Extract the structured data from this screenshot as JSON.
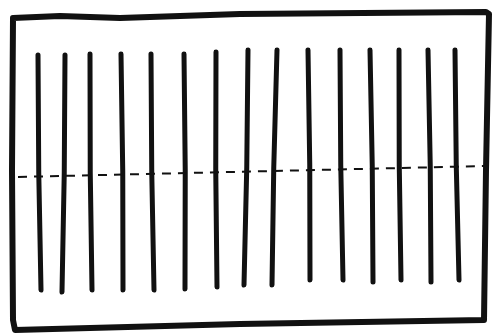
{
  "diagram": {
    "stroke_color": "#111111",
    "background": "#ffffff",
    "frame": {
      "points": [
        [
          13,
          18
        ],
        [
          60,
          16
        ],
        [
          120,
          18
        ],
        [
          240,
          14
        ],
        [
          486,
          12
        ],
        [
          489,
          14
        ],
        [
          486,
          170
        ],
        [
          484,
          320
        ],
        [
          240,
          324
        ],
        [
          15,
          330
        ],
        [
          13,
          320
        ],
        [
          12,
          170
        ],
        [
          13,
          18
        ]
      ],
      "stroke_width": 6
    },
    "vertical_lines": [
      {
        "x_top": 38,
        "y_top": 55,
        "x_bottom": 41,
        "y_bottom": 290
      },
      {
        "x_top": 65,
        "y_top": 55,
        "x_bottom": 62,
        "y_bottom": 292
      },
      {
        "x_top": 90,
        "y_top": 54,
        "x_bottom": 92,
        "y_bottom": 290
      },
      {
        "x_top": 121,
        "y_top": 54,
        "x_bottom": 123,
        "y_bottom": 290
      },
      {
        "x_top": 151,
        "y_top": 54,
        "x_bottom": 154,
        "y_bottom": 290
      },
      {
        "x_top": 184,
        "y_top": 54,
        "x_bottom": 185,
        "y_bottom": 289
      },
      {
        "x_top": 216,
        "y_top": 52,
        "x_bottom": 217,
        "y_bottom": 287
      },
      {
        "x_top": 248,
        "y_top": 50,
        "x_bottom": 244,
        "y_bottom": 285
      },
      {
        "x_top": 277,
        "y_top": 50,
        "x_bottom": 272,
        "y_bottom": 285
      },
      {
        "x_top": 308,
        "y_top": 50,
        "x_bottom": 310,
        "y_bottom": 280
      },
      {
        "x_top": 340,
        "y_top": 50,
        "x_bottom": 343,
        "y_bottom": 280
      },
      {
        "x_top": 370,
        "y_top": 50,
        "x_bottom": 373,
        "y_bottom": 282
      },
      {
        "x_top": 399,
        "y_top": 50,
        "x_bottom": 401,
        "y_bottom": 280
      },
      {
        "x_top": 428,
        "y_top": 50,
        "x_bottom": 431,
        "y_bottom": 282
      },
      {
        "x_top": 455,
        "y_top": 50,
        "x_bottom": 459,
        "y_bottom": 280
      }
    ],
    "vertical_stroke_width": 5,
    "dashed_line": {
      "x1": 18,
      "y1": 177,
      "x2": 486,
      "y2": 166,
      "dash": "9 7",
      "stroke_width": 2
    }
  }
}
